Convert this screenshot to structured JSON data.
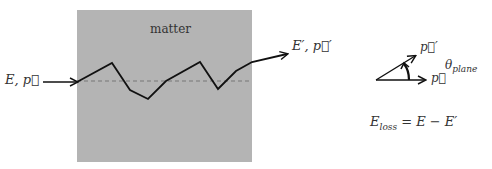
{
  "diagram": {
    "region_label": "matter",
    "incoming_label": "E, p⃗",
    "outgoing_label": "E′, p⃗′",
    "vector_p_label": "p⃗",
    "vector_p_prime_label": "p⃗′",
    "angle_label": "θ",
    "angle_subscript": "plane",
    "energy_loss_lhs": "E",
    "energy_loss_subscript": "loss",
    "energy_loss_rhs": "= E − E′",
    "colors": {
      "matter_fill": "#b4b4b4",
      "path_stroke": "#111111",
      "dashed_line": "#777777"
    }
  }
}
